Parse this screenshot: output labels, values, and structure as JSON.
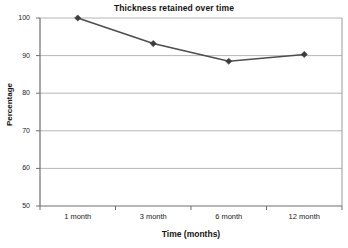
{
  "chart_data": {
    "type": "line",
    "title": "Thickness retained over time",
    "xlabel": "Time (months)",
    "ylabel": "Percentage",
    "categories": [
      "1 month",
      "3 month",
      "6 month",
      "12 month"
    ],
    "values": [
      100,
      93.2,
      88.5,
      90.3
    ],
    "series": [
      {
        "name": "Thickness retained",
        "values": [
          100,
          93.2,
          88.5,
          90.3
        ]
      }
    ],
    "ylim": [
      50,
      100
    ],
    "yticks": [
      50,
      60,
      70,
      80,
      90,
      100
    ],
    "ytick_labels": [
      "50",
      "60",
      "70",
      "80",
      "90",
      "100"
    ],
    "grid": "horizontal",
    "legend": "none",
    "marker": "diamond",
    "line_color": "#4d4d4d",
    "marker_color": "#3c3c3c",
    "grid_color": "#b0b0b0",
    "axis_color": "#808080",
    "text_color": "#141414",
    "background": "#ffffff"
  },
  "axes": {
    "y_tick_0": "50",
    "y_tick_1": "60",
    "y_tick_2": "70",
    "y_tick_3": "80",
    "y_tick_4": "90",
    "y_tick_5": "100",
    "x_tick_0": "1 month",
    "x_tick_1": "3 month",
    "x_tick_2": "6 month",
    "x_tick_3": "12 month"
  }
}
